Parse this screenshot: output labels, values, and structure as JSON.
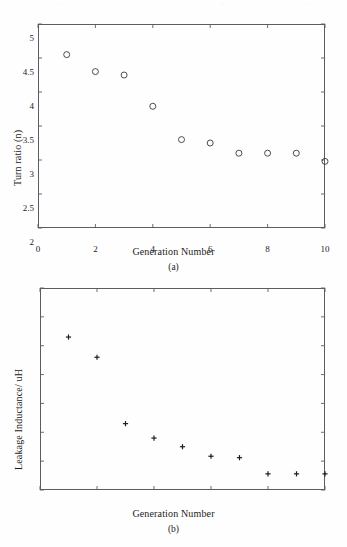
{
  "page": {
    "scan_artifacts": [
      "··",
      "—··—",
      "·",
      "·",
      "▪",
      "—·—·"
    ]
  },
  "chart_data": [
    {
      "id": "panel-a",
      "type": "scatter",
      "title": "",
      "caption": "(a)",
      "xlabel": "Generation Number",
      "ylabel": "Turn ratio (n)",
      "xlim": [
        0,
        10
      ],
      "ylim": [
        2,
        5
      ],
      "xticks": [
        0,
        2,
        4,
        6,
        8,
        10
      ],
      "xticklabels": [
        "0",
        "2",
        "4",
        "6",
        "8",
        "10"
      ],
      "yticks": [
        2,
        2.5,
        3,
        3.5,
        4,
        4.5,
        5
      ],
      "yticklabels": [
        "2",
        "2.5",
        "3",
        "3.5",
        "4",
        "4.5",
        "5"
      ],
      "grid": false,
      "legend": null,
      "marker": "open-circle",
      "marker_color": "#3a3a40",
      "x": [
        1,
        2,
        3,
        4,
        5,
        6,
        7,
        8,
        9,
        10
      ],
      "values": [
        4.55,
        4.3,
        4.25,
        3.79,
        3.3,
        3.25,
        3.1,
        3.1,
        3.1,
        2.98
      ]
    },
    {
      "id": "panel-b",
      "type": "scatter",
      "title": "",
      "caption": "(b)",
      "xlabel": "Generation Number",
      "ylabel": "Leakage Inductance/ uH",
      "xlim": [
        0,
        10
      ],
      "ylim": [
        30,
        100
      ],
      "xticks": [
        0,
        2,
        4,
        6,
        8,
        10
      ],
      "xticklabels": [
        "0",
        "2",
        "4",
        "6",
        "8",
        "10"
      ],
      "yticks": [
        30,
        40,
        50,
        60,
        70,
        80,
        90,
        100
      ],
      "yticklabels": [
        "30",
        "40",
        "50",
        "60",
        "70",
        "80",
        "90",
        "100"
      ],
      "grid": false,
      "legend": null,
      "marker": "plus",
      "marker_color": "#1d1d20",
      "x": [
        1,
        2,
        3,
        4,
        5,
        6,
        7,
        8,
        9,
        10
      ],
      "values": [
        83,
        76,
        53,
        48,
        45,
        41.7,
        41.2,
        35.6,
        35.6,
        35.6
      ]
    }
  ]
}
